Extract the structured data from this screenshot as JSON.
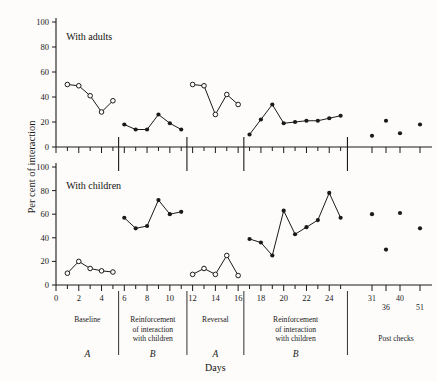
{
  "chart_data": {
    "type": "line",
    "title": "",
    "xlabel": "Days",
    "ylabel": "Per cent of interaction",
    "ylim": [
      0,
      100
    ],
    "yticks": [
      0,
      20,
      40,
      60,
      80,
      100
    ],
    "xlim": [
      0,
      26
    ],
    "xticks": [
      0,
      2,
      4,
      6,
      8,
      10,
      12,
      14,
      16,
      18,
      20,
      22,
      24
    ],
    "grid": false,
    "legend": "none",
    "panels": [
      {
        "name": "With adults",
        "series": [
          {
            "name": "Baseline",
            "phase": "A",
            "marker": "open-circle",
            "x": [
              1,
              2,
              3,
              4,
              5
            ],
            "values": [
              50,
              49,
              41,
              28,
              37
            ]
          },
          {
            "name": "Reinforcement of interaction with children",
            "phase": "B",
            "marker": "filled-circle",
            "x": [
              6,
              7,
              8,
              9,
              10,
              11
            ],
            "values": [
              18,
              14,
              14,
              26,
              19,
              14
            ]
          },
          {
            "name": "Reversal",
            "phase": "A",
            "marker": "open-circle",
            "x": [
              12,
              13,
              14,
              15,
              16
            ],
            "values": [
              50,
              49,
              26,
              42,
              34
            ]
          },
          {
            "name": "Reinforcement of interaction with children",
            "phase": "B",
            "marker": "filled-circle",
            "x": [
              17,
              18,
              19,
              20,
              21,
              22,
              23,
              24,
              25
            ],
            "values": [
              10,
              22,
              34,
              19,
              20,
              21,
              21,
              23,
              25
            ]
          },
          {
            "name": "Post checks",
            "phase": "Post checks",
            "marker": "filled-circle",
            "connected": false,
            "x": [
              31,
              36,
              40,
              51
            ],
            "values": [
              9,
              21,
              11,
              18
            ]
          }
        ]
      },
      {
        "name": "With children",
        "series": [
          {
            "name": "Baseline",
            "phase": "A",
            "marker": "open-circle",
            "x": [
              1,
              2,
              3,
              4,
              5
            ],
            "values": [
              10,
              20,
              14,
              12,
              11
            ]
          },
          {
            "name": "Reinforcement of interaction with children",
            "phase": "B",
            "marker": "filled-circle",
            "x": [
              6,
              7,
              8,
              9,
              10,
              11
            ],
            "values": [
              57,
              48,
              50,
              72,
              60,
              62
            ]
          },
          {
            "name": "Reversal",
            "phase": "A",
            "marker": "open-circle",
            "x": [
              12,
              13,
              14,
              15,
              16
            ],
            "values": [
              9,
              14,
              9,
              25,
              8
            ]
          },
          {
            "name": "Reinforcement of interaction with children",
            "phase": "B",
            "marker": "filled-circle",
            "x": [
              17,
              18,
              19,
              20,
              21,
              22,
              23,
              24,
              25
            ],
            "values": [
              39,
              36,
              25,
              63,
              43,
              49,
              55,
              78,
              57
            ]
          },
          {
            "name": "Post checks",
            "phase": "Post checks",
            "marker": "filled-circle",
            "connected": false,
            "x": [
              31,
              36,
              40,
              51
            ],
            "values": [
              60,
              30,
              61,
              48
            ]
          }
        ]
      }
    ],
    "phase_labels": [
      {
        "label": "Baseline",
        "letter": "A"
      },
      {
        "label": "Reinforcement of interaction with children",
        "letter": "B"
      },
      {
        "label": "Reversal",
        "letter": "A"
      },
      {
        "label": "Reinforcement of interaction with children",
        "letter": "B"
      },
      {
        "label": "Post checks",
        "letter": ""
      }
    ],
    "post_check_days": [
      "31",
      "36",
      "40",
      "51"
    ]
  },
  "axes": {
    "y_label": "Per cent of interaction",
    "x_label": "Days",
    "y_ticks": [
      "0",
      "20",
      "40",
      "60",
      "80",
      "100"
    ],
    "x_ticks": [
      "0",
      "2",
      "4",
      "6",
      "8",
      "10",
      "12",
      "14",
      "16",
      "18",
      "20",
      "22",
      "24"
    ]
  },
  "panels": {
    "top_title": "With adults",
    "bottom_title": "With children"
  },
  "phases": {
    "p1_line1": "Baseline",
    "p2_line1": "Reinforcement",
    "p2_line2": "of interaction",
    "p2_line3": "with children",
    "p3_line1": "Reversal",
    "p4_line1": "Reinforcement",
    "p4_line2": "of  interaction",
    "p4_line3": "with children",
    "p5_line1": "Post checks",
    "letter_a1": "A",
    "letter_b1": "B",
    "letter_a2": "A",
    "letter_b2": "B"
  },
  "postchecks": {
    "d31": "31",
    "d36": "36",
    "d40": "40",
    "d51": "51"
  },
  "colors": {
    "ink": "#1a1a1a",
    "background": "#fdfcfa"
  }
}
